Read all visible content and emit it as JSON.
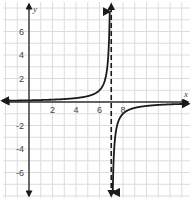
{
  "chart_data": {
    "type": "line",
    "title": "",
    "function": "y = -1/(x - 7)",
    "xlabel": "x",
    "ylabel": "y",
    "xlim": [
      -2.3,
      13.8
    ],
    "ylim": [
      -8.2,
      8.7
    ],
    "grid": true,
    "grid_step": 1,
    "x_ticks": [
      2,
      4,
      6,
      8
    ],
    "x_tick_labels": [
      "2",
      "4",
      "6",
      "8"
    ],
    "y_ticks": [
      6,
      4,
      2,
      -2,
      -4,
      -6
    ],
    "y_tick_labels": [
      "6",
      "4",
      "2",
      "-2",
      "-4",
      "-6"
    ],
    "vertical_asymptote": 7,
    "horizontal_asymptote": 0,
    "series": [
      {
        "name": "left-branch",
        "x_range": [
          -2.3,
          6.87
        ],
        "direction": "approaches +infinity as x→7⁻"
      },
      {
        "name": "right-branch",
        "x_range": [
          7.13,
          13.6
        ],
        "direction": "approaches -infinity as x→7⁺"
      }
    ],
    "colors": {
      "curve": "#1a1a1a",
      "grid": "#dcdcdc",
      "axis": "#333333"
    }
  }
}
